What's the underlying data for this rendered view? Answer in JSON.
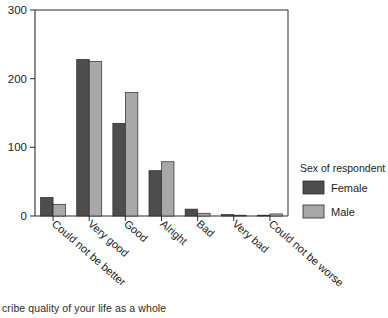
{
  "chart_data": {
    "type": "bar",
    "title": "",
    "subtitle": "",
    "xlabel": "",
    "ylabel": "",
    "ylim": [
      0,
      300
    ],
    "yticks": [
      0,
      100,
      200,
      300
    ],
    "grid": false,
    "legend_position": "right",
    "categories": [
      "Could not be better",
      "Very good",
      "Good",
      "Alright",
      "Bad",
      "Very bad",
      "Could not be worse"
    ],
    "series": [
      {
        "name": "Female",
        "color": "#4d4d4d",
        "values": [
          27,
          228,
          135,
          66,
          10,
          2,
          1
        ]
      },
      {
        "name": "Male",
        "color": "#a8a8a8",
        "values": [
          17,
          225,
          180,
          79,
          4,
          1,
          3
        ]
      }
    ],
    "legend_title": "Sex of respondent",
    "caption": "cribe quality of your life as a whole"
  },
  "axis": {
    "y_tick_labels": [
      "300",
      "200",
      "100",
      "0"
    ]
  },
  "legend": {
    "title": "Sex of respondent",
    "entries": [
      {
        "label": "Female",
        "color": "#4d4d4d"
      },
      {
        "label": "Male",
        "color": "#a8a8a8"
      }
    ]
  },
  "caption": {
    "text": "cribe quality of your life as a whole"
  },
  "colors": {
    "female": "#4d4d4d",
    "male": "#a8a8a8",
    "axis": "#1c1c1c",
    "background": "#ffffff"
  }
}
